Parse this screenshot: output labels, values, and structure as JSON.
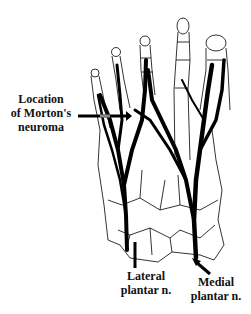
{
  "figure": {
    "labels": {
      "morton": {
        "line1": "Location",
        "line2": "of Morton's",
        "line3": "neuroma"
      },
      "lateral": {
        "line1": "Lateral",
        "line2": "plantar n."
      },
      "medial": {
        "line1": "Medial",
        "line2": "plantar n."
      }
    },
    "colors": {
      "nerve": "#000000",
      "bone_outline": "#000000",
      "background": "#ffffff"
    }
  }
}
